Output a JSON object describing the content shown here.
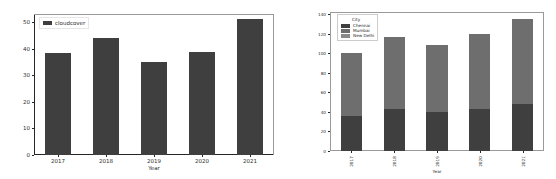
{
  "figure_background": "#ffffff",
  "charts": [
    {
      "id": "cloudcover-bar-chart",
      "title": "",
      "legend": {
        "title": "",
        "entries": [
          {
            "label": "cloudcover",
            "color": "#3f3f3f"
          }
        ]
      },
      "axis": {
        "xlabel": "Year",
        "ylabel": "",
        "yticks": [
          "0",
          "10",
          "20",
          "30",
          "40",
          "50"
        ],
        "xticks": [
          "2017",
          "2018",
          "2019",
          "2020",
          "2021"
        ]
      },
      "chart_data": {
        "type": "bar",
        "title": "",
        "xlabel": "Year",
        "ylabel": "",
        "categories": [
          "2017",
          "2018",
          "2019",
          "2020",
          "2021"
        ],
        "values": [
          38.5,
          44.0,
          35.0,
          38.8,
          51.0
        ],
        "series": [
          {
            "name": "cloudcover",
            "color": "#3f3f3f",
            "values": [
              38.5,
              44.0,
              35.0,
              38.8,
              51.0
            ]
          }
        ],
        "ylim": [
          0,
          53
        ],
        "yticks": [
          0,
          10,
          20,
          30,
          40,
          50
        ],
        "grid": false,
        "legend_position": "upper-left"
      }
    },
    {
      "id": "city-stacked-bar-chart",
      "title": "",
      "legend": {
        "title": "City",
        "entries": [
          {
            "label": "Chennai",
            "color": "#3f3f3f"
          },
          {
            "label": "Mumbai",
            "color": "#6e6e6e"
          },
          {
            "label": "New Delhi",
            "color": "#8a8a8a"
          }
        ]
      },
      "axis": {
        "xlabel": "Year",
        "ylabel": "",
        "yticks": [
          "0",
          "20",
          "40",
          "60",
          "80",
          "100",
          "120",
          "140"
        ],
        "xticks": [
          "2017",
          "2018",
          "2019",
          "2020",
          "2021"
        ]
      },
      "chart_data": {
        "type": "bar",
        "stacked": true,
        "title": "",
        "xlabel": "Year",
        "ylabel": "",
        "categories": [
          "2017",
          "2018",
          "2019",
          "2020",
          "2021"
        ],
        "series": [
          {
            "name": "Chennai",
            "color": "#3f3f3f",
            "values": [
              36,
              43,
              40,
              43,
              48
            ]
          },
          {
            "name": "Mumbai",
            "color": "#6e6e6e",
            "values": [
              64,
              73,
              68,
              77,
              87
            ]
          },
          {
            "name": "New Delhi",
            "color": "#8a8a8a",
            "values": [
              0,
              0,
              0,
              0,
              0
            ]
          }
        ],
        "totals": [
          100,
          116,
          108,
          120,
          135
        ],
        "ylim": [
          0,
          142
        ],
        "yticks": [
          0,
          20,
          40,
          60,
          80,
          100,
          120,
          140
        ],
        "grid": false,
        "legend_position": "upper-left"
      }
    }
  ]
}
